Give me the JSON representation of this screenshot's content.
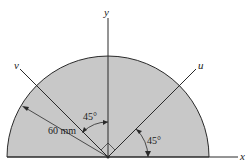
{
  "diagram": {
    "type": "semicircular plate with rotated axes",
    "colors": {
      "fill": "#c8c8c8",
      "stroke": "#2a2a2a",
      "background": "#ffffff"
    },
    "axes": {
      "x_label": "x",
      "y_label": "y",
      "u_label": "u",
      "v_label": "v"
    },
    "annotations": {
      "radius_label": "60 mm",
      "angle_v_label": "45°",
      "angle_u_label": "45°"
    },
    "geometry": {
      "shape": "semicircle",
      "radius": "60 mm",
      "u_axis_angle_from_x_deg": 45,
      "v_axis_angle_from_y_deg": 45,
      "u_v_perpendicular": true
    }
  }
}
